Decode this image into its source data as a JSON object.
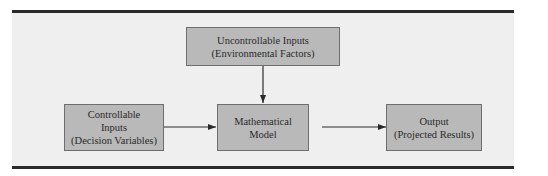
{
  "diagram": {
    "nodes": [
      {
        "id": "uncontrollable",
        "lines": [
          "Uncontrollable Inputs",
          "(Environmental Factors)"
        ]
      },
      {
        "id": "controllable",
        "lines": [
          "Controllable",
          "Inputs",
          "(Decision Variables)"
        ]
      },
      {
        "id": "model",
        "lines": [
          "Mathematical",
          "Model"
        ]
      },
      {
        "id": "output",
        "lines": [
          "Output",
          "(Projected Results)"
        ]
      }
    ],
    "edges": [
      {
        "from": "uncontrollable",
        "to": "model"
      },
      {
        "from": "controllable",
        "to": "model"
      },
      {
        "from": "model",
        "to": "output"
      }
    ],
    "colors": {
      "box_fill": "#b9b9b9",
      "box_border": "#6e6e6e",
      "panel": "#efefef",
      "rule": "#2a2a2a",
      "arrow": "#2a2a2a"
    }
  }
}
